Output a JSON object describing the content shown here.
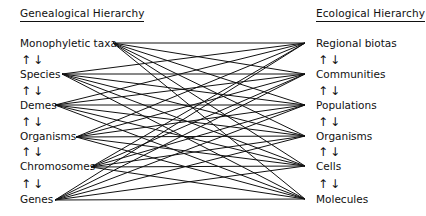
{
  "left": {
    "title": "Genealogical Hierarchy",
    "levels": [
      "Monophyletic taxa",
      "Species",
      "Demes",
      "Organisms",
      "Chromosomes",
      "Genes"
    ],
    "anchors": [
      [
        113,
        43
      ],
      [
        62,
        74
      ],
      [
        55,
        105
      ],
      [
        76,
        137
      ],
      [
        91,
        167
      ],
      [
        55,
        200
      ]
    ]
  },
  "right": {
    "title": "Ecological Hierarchy",
    "levels": [
      "Regional biotas",
      "Communities",
      "Populations",
      "Organisms",
      "Cells",
      "Molecules"
    ],
    "anchors": [
      [
        305,
        43
      ],
      [
        305,
        74
      ],
      [
        305,
        105
      ],
      [
        305,
        136
      ],
      [
        305,
        166
      ],
      [
        305,
        199
      ]
    ]
  },
  "arrows": {
    "up": "↑",
    "down": "↓"
  },
  "colors": {
    "line": "#111111",
    "text": "#111111"
  }
}
